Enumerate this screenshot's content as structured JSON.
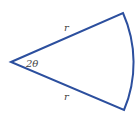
{
  "diagram": {
    "type": "circular-sector",
    "stroke_color": "#2c4f9e",
    "labels": {
      "top_radius": "r",
      "bottom_radius": "r",
      "angle": "2θ"
    },
    "geometry": {
      "apex": [
        11,
        62
      ],
      "top_corner": [
        123,
        13
      ],
      "bottom_corner": [
        124,
        110
      ],
      "radius_px": 122
    }
  }
}
